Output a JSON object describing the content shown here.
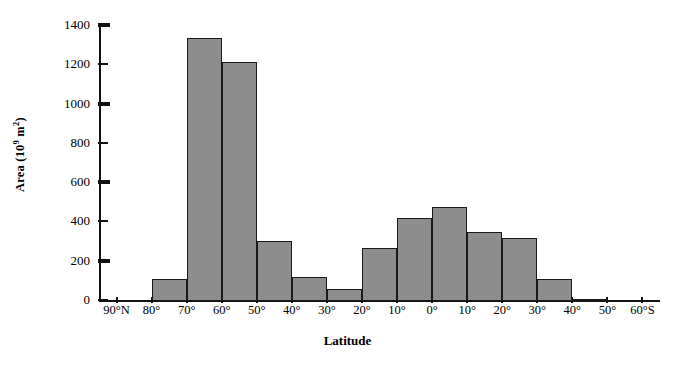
{
  "chart_data": {
    "type": "bar",
    "title": "",
    "xlabel": "Latitude",
    "ylabel": "Area (10⁹ m²)",
    "ylabel_parts": {
      "prefix": "Area (10",
      "exponent": "9",
      "suffix": " m",
      "unit_exponent": "2",
      "close": ")"
    },
    "ylim": [
      0,
      1400
    ],
    "ytick_values": [
      0,
      200,
      400,
      600,
      800,
      1000,
      1200,
      1400
    ],
    "ytick_labels": [
      "0",
      "200",
      "400",
      "600",
      "800",
      "1000",
      "1200",
      "1400"
    ],
    "grid": false,
    "legend": "none",
    "bar_color": "#8d8d8d",
    "bar_edge_color": "#1a1a1a",
    "axis_color": "#111111",
    "xtick_labels": [
      "90°N",
      "80°",
      "70°",
      "60°",
      "50°",
      "40°",
      "30°",
      "20°",
      "10°",
      "0°",
      "10°",
      "20°",
      "30°",
      "40°",
      "50°",
      "60°S"
    ],
    "categories": [
      "90°N–80°N",
      "80°N–70°N",
      "70°N–60°N",
      "60°N–50°N",
      "50°N–40°N",
      "40°N–30°N",
      "30°N–20°N",
      "20°N–10°N",
      "10°N–0°",
      "0°–10°S",
      "10°S–20°S",
      "20°S–30°S",
      "30°S–40°S",
      "40°S–50°S",
      "50°S–60°S"
    ],
    "values": [
      0,
      110,
      1340,
      1215,
      305,
      120,
      60,
      270,
      425,
      480,
      350,
      320,
      110,
      8,
      0
    ]
  }
}
